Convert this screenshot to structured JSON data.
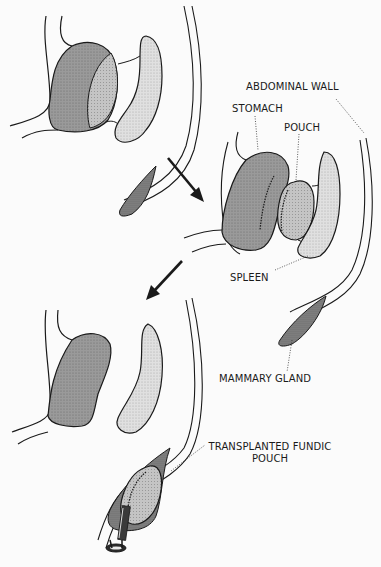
{
  "diagram": {
    "type": "anatomical-procedure",
    "stages": [
      {
        "id": "original",
        "description": "stomach and spleen with abdominal wall"
      },
      {
        "id": "pouch-created",
        "description": "fundic pouch separated from stomach"
      },
      {
        "id": "transplanted",
        "description": "pouch transplanted into mammary gland region with cannula"
      }
    ],
    "labels": {
      "abdominal_wall": "ABDOMINAL WALL",
      "stomach": "STOMACH",
      "pouch": "POUCH",
      "spleen": "SPLEEN",
      "mammary_gland": "MAMMARY GLAND",
      "transplanted_line1": "TRANSPLANTED FUNDIC",
      "transplanted_line2": "POUCH"
    },
    "arrows": [
      {
        "from": "stage-1",
        "to": "stage-2",
        "direction": "down-right"
      },
      {
        "from": "stage-2",
        "to": "stage-3",
        "direction": "down-left"
      }
    ],
    "colors": {
      "stroke": "#1a1a1a",
      "stomach_fill": "#9a9a9a",
      "pouch_fill": "#bdbdbd",
      "spleen_fill": "#d6d6d6",
      "gland_fill": "#7a7a7a",
      "background": "#fbfbfb"
    }
  }
}
